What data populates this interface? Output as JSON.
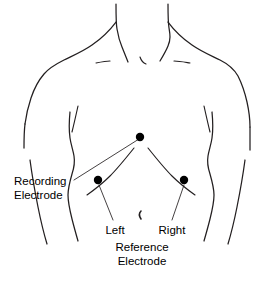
{
  "figure": {
    "background_color": "#ffffff",
    "line_color": "#231f20",
    "electrode_color": "#000000"
  },
  "labels": {
    "recording_line1": "Recording",
    "recording_line2": "Electrode",
    "left": "Left",
    "right": "Right",
    "reference_line1": "Reference",
    "reference_line2": "Electrode"
  },
  "electrodes": [
    {
      "name": "recording-electrode",
      "label": "Recording Electrode",
      "position": "sternum-center",
      "x": 140,
      "y": 137,
      "radius": 4.2
    },
    {
      "name": "left-reference-electrode",
      "label": "Left",
      "position": "lower-left-ribcage",
      "x": 98,
      "y": 180,
      "radius": 4.2
    },
    {
      "name": "right-reference-electrode",
      "label": "Right",
      "position": "lower-right-ribcage",
      "x": 184,
      "y": 180,
      "radius": 4.2
    }
  ],
  "landmarks": [
    {
      "name": "navel",
      "x": 141,
      "y": 216
    }
  ]
}
